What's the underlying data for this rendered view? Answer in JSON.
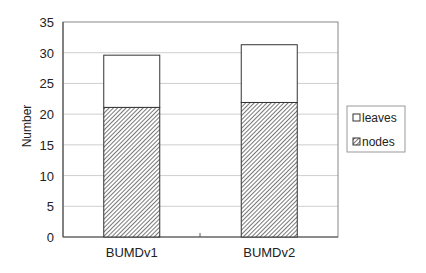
{
  "chart_data": {
    "type": "bar",
    "stacked": true,
    "title": "",
    "xlabel": "",
    "ylabel": "Number",
    "ylim": [
      0,
      35
    ],
    "yticks": [
      0,
      5,
      10,
      15,
      20,
      25,
      30,
      35
    ],
    "grid": true,
    "legend_position": "right",
    "categories": [
      "BUMDv1",
      "BUMDv2"
    ],
    "series": [
      {
        "name": "nodes",
        "values": [
          21.1,
          21.9
        ],
        "fill": "hatched"
      },
      {
        "name": "leaves",
        "values": [
          8.5,
          9.4
        ],
        "fill": "white"
      }
    ],
    "totals": [
      29.6,
      31.3
    ]
  },
  "legend": {
    "items": [
      {
        "label": "leaves"
      },
      {
        "label": "nodes"
      }
    ]
  },
  "axis": {
    "ylabel": "Number",
    "yticks": [
      "0",
      "5",
      "10",
      "15",
      "20",
      "25",
      "30",
      "35"
    ],
    "xticks": [
      "BUMDv1",
      "BUMDv2"
    ]
  }
}
